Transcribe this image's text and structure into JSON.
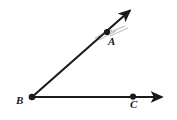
{
  "figure": {
    "background_color": "#ffffff",
    "stroke_color": "#1a1a1a",
    "width": 177,
    "height": 120
  },
  "points": [
    {
      "id": "A",
      "label": "A",
      "x": 107,
      "y": 32,
      "label_x": 108,
      "label_y": 36,
      "marker": "filled-dot"
    },
    {
      "id": "B",
      "label": "B",
      "x": 32,
      "y": 97,
      "label_x": 16,
      "label_y": 95,
      "marker": "filled-dot"
    },
    {
      "id": "C",
      "label": "C",
      "x": 133,
      "y": 97,
      "label_x": 130,
      "label_y": 99,
      "marker": "filled-dot"
    }
  ],
  "rays": [
    {
      "id": "ray-BA",
      "from": "B",
      "through": "A",
      "start_x": 32,
      "start_y": 97,
      "end_x": 134,
      "end_y": 7,
      "arrowhead": "end"
    },
    {
      "id": "ray-BC",
      "from": "B",
      "through": "C",
      "start_x": 32,
      "start_y": 97,
      "end_x": 167,
      "end_y": 97,
      "arrowhead": "end"
    }
  ],
  "tick_marks": {
    "id": "tick-marks-near-A",
    "description": "faint short strokes crossing ray BA near point A"
  }
}
